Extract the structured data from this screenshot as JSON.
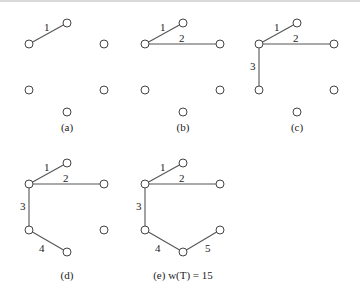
{
  "figure": {
    "panels": [
      {
        "id": "a",
        "caption": "(a)",
        "edges": [
          {
            "from": "B",
            "to": "A",
            "weight": "1"
          }
        ]
      },
      {
        "id": "b",
        "caption": "(b)",
        "edges": [
          {
            "from": "B",
            "to": "A",
            "weight": "1"
          },
          {
            "from": "B",
            "to": "C",
            "weight": "2"
          }
        ]
      },
      {
        "id": "c",
        "caption": "(c)",
        "edges": [
          {
            "from": "B",
            "to": "A",
            "weight": "1"
          },
          {
            "from": "B",
            "to": "C",
            "weight": "2"
          },
          {
            "from": "B",
            "to": "D",
            "weight": "3"
          }
        ]
      },
      {
        "id": "d",
        "caption": "(d)",
        "edges": [
          {
            "from": "B",
            "to": "A",
            "weight": "1"
          },
          {
            "from": "B",
            "to": "C",
            "weight": "2"
          },
          {
            "from": "B",
            "to": "D",
            "weight": "3"
          },
          {
            "from": "D",
            "to": "F",
            "weight": "4"
          }
        ]
      },
      {
        "id": "e",
        "caption": "(e) w(T) = 15",
        "edges": [
          {
            "from": "B",
            "to": "A",
            "weight": "1"
          },
          {
            "from": "B",
            "to": "C",
            "weight": "2"
          },
          {
            "from": "B",
            "to": "D",
            "weight": "3"
          },
          {
            "from": "D",
            "to": "F",
            "weight": "4"
          },
          {
            "from": "F",
            "to": "E",
            "weight": "5"
          }
        ]
      }
    ],
    "labels": {
      "a": "(a)",
      "b": "(b)",
      "c": "(c)",
      "d": "(d)",
      "e": "(e) w(T) = 15",
      "w1": "1",
      "w2": "2",
      "w3": "3",
      "w4": "4",
      "w5": "5"
    }
  }
}
